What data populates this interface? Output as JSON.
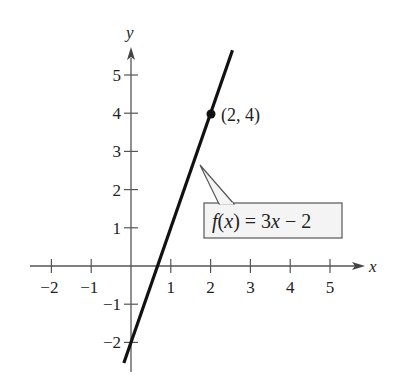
{
  "chart_data": {
    "type": "line",
    "title": "",
    "xlabel": "x",
    "ylabel": "y",
    "xlim": [
      -2.4,
      6
    ],
    "ylim": [
      -2.4,
      5.9
    ],
    "grid": false,
    "x_ticks": [
      -2,
      -1,
      1,
      2,
      3,
      4,
      5
    ],
    "x_tick_labels": [
      "−2",
      "−1",
      "1",
      "2",
      "3",
      "4",
      "5"
    ],
    "y_ticks": [
      -2,
      -1,
      1,
      2,
      3,
      4,
      5
    ],
    "y_tick_labels": [
      "−2",
      "−1",
      "1",
      "2",
      "3",
      "4",
      "5"
    ],
    "series": [
      {
        "name": "f(x) = 3x − 2",
        "equation": "f(x) = 3x - 2",
        "slope": 3,
        "intercept": -2,
        "x": [
          -0.18,
          2.55
        ],
        "y": [
          -2.54,
          5.65
        ],
        "color": "#111111"
      }
    ],
    "points": [
      {
        "x": 2,
        "y": 4,
        "label": "(2, 4)"
      }
    ],
    "annotations": [
      {
        "text": "f(x) = 3x − 2",
        "type": "callout-box",
        "points_to": [
          1.75,
          3.25
        ]
      }
    ]
  },
  "labels": {
    "x_axis": "x",
    "y_axis": "y",
    "point": "(2, 4)",
    "function_f": "f",
    "function_rest": "(",
    "function_x": "x",
    "function_tail": ") = 3",
    "function_x2": "x",
    "function_end": " − 2"
  },
  "colors": {
    "axis": "#555555",
    "line": "#111111",
    "box_fill": "#f4f4f4",
    "box_stroke": "#555555"
  }
}
